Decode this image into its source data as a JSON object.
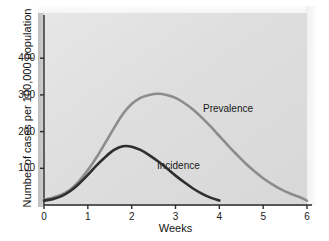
{
  "chart_data": {
    "type": "line",
    "title": "",
    "subtitle": "",
    "xlabel": "Weeks",
    "ylabel": "Number of cases per 100,000 population",
    "xlim": [
      0,
      6
    ],
    "ylim": [
      0,
      460
    ],
    "xticks": [
      "0",
      "1",
      "2",
      "3",
      "4",
      "5",
      "6"
    ],
    "xtick_values": [
      0,
      1,
      2,
      3,
      4,
      5,
      6
    ],
    "yticks": [
      "100",
      "200",
      "300",
      "400"
    ],
    "ytick_values": [
      100,
      200,
      300,
      400
    ],
    "grid": false,
    "legend_position": "inline-annotation",
    "annotations": [
      {
        "text": "Prevalence",
        "x": 3.75,
        "y": 265
      },
      {
        "text": "Incidence",
        "x": 2.6,
        "y": 115
      }
    ],
    "series": [
      {
        "name": "Prevalence",
        "color": "#8c8c8c",
        "line_width": 2.6,
        "x": [
          0.0,
          0.2,
          0.4,
          0.6,
          0.8,
          1.0,
          1.2,
          1.4,
          1.6,
          1.8,
          2.0,
          2.2,
          2.4,
          2.6,
          2.8,
          3.0,
          3.2,
          3.4,
          3.6,
          3.8,
          4.0,
          4.2,
          4.4,
          4.6,
          4.8,
          5.0,
          5.2,
          5.4,
          5.6,
          5.8,
          6.0
        ],
        "values": [
          15,
          20,
          28,
          42,
          65,
          95,
          130,
          170,
          210,
          248,
          275,
          292,
          300,
          303,
          300,
          292,
          278,
          260,
          238,
          214,
          188,
          162,
          137,
          113,
          92,
          73,
          57,
          43,
          32,
          23,
          12
        ]
      },
      {
        "name": "Incidence",
        "color": "#2e2e2e",
        "line_width": 2.6,
        "x": [
          0.0,
          0.2,
          0.4,
          0.6,
          0.8,
          1.0,
          1.2,
          1.4,
          1.6,
          1.8,
          2.0,
          2.2,
          2.4,
          2.6,
          2.8,
          3.0,
          3.2,
          3.4,
          3.6,
          3.8,
          4.0
        ],
        "values": [
          12,
          16,
          24,
          38,
          58,
          82,
          108,
          131,
          150,
          160,
          159,
          150,
          136,
          119,
          100,
          80,
          62,
          45,
          31,
          20,
          12
        ]
      }
    ]
  },
  "axes": {
    "y_title": "Number of cases per 100,000 population",
    "x_title": "Weeks",
    "y_tick_labels": [
      "400",
      "300",
      "200",
      "100"
    ],
    "x_tick_labels": [
      "0",
      "1",
      "2",
      "3",
      "4",
      "5",
      "6"
    ]
  },
  "labels": {
    "prevalence": "Prevalence",
    "incidence": "Incidence"
  },
  "colors": {
    "panel_background": "#dcdcdc",
    "page_background": "#ffffff",
    "axis": "#2b2b2b",
    "prevalence_line": "#8c8c8c",
    "incidence_line": "#2e2e2e",
    "text": "#1a1a1a"
  }
}
